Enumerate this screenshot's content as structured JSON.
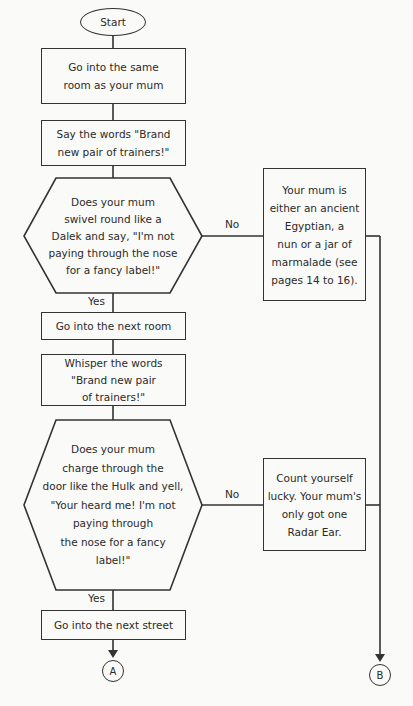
{
  "flowchart": {
    "start": "Start",
    "steps": {
      "step1": "Go into the same\nroom as your mum",
      "step2": "Say the words \"Brand\nnew pair of trainers!\"",
      "decision1": "Does your mum\nswivel round like a\nDalek and say, \"I'm not\npaying through the nose\nfor a fancy label!\"",
      "outcome1": "Your mum is\neither an ancient\nEgyptian, a\nnun or a jar of\nmarmalade (see\npages 14 to 16).",
      "step3": "Go into the next room",
      "step4": "Whisper the words\n\"Brand new pair\nof trainers!\"",
      "decision2": "Does your mum\ncharge through the\ndoor like the Hulk and yell,\n\"Your heard me! I'm not\npaying through\nthe nose for a fancy\nlabel!\"",
      "outcome2": "Count yourself\nlucky. Your mum's\nonly got one\nRadar Ear.",
      "step5": "Go into the next street"
    },
    "branch_labels": {
      "d1_no": "No",
      "d1_yes": "Yes",
      "d2_no": "No",
      "d2_yes": "Yes"
    },
    "connectors": {
      "a": "A",
      "b": "B"
    }
  },
  "colors": {
    "line": "#333333",
    "background": "#fafaf8",
    "text": "#2a2a2a"
  }
}
